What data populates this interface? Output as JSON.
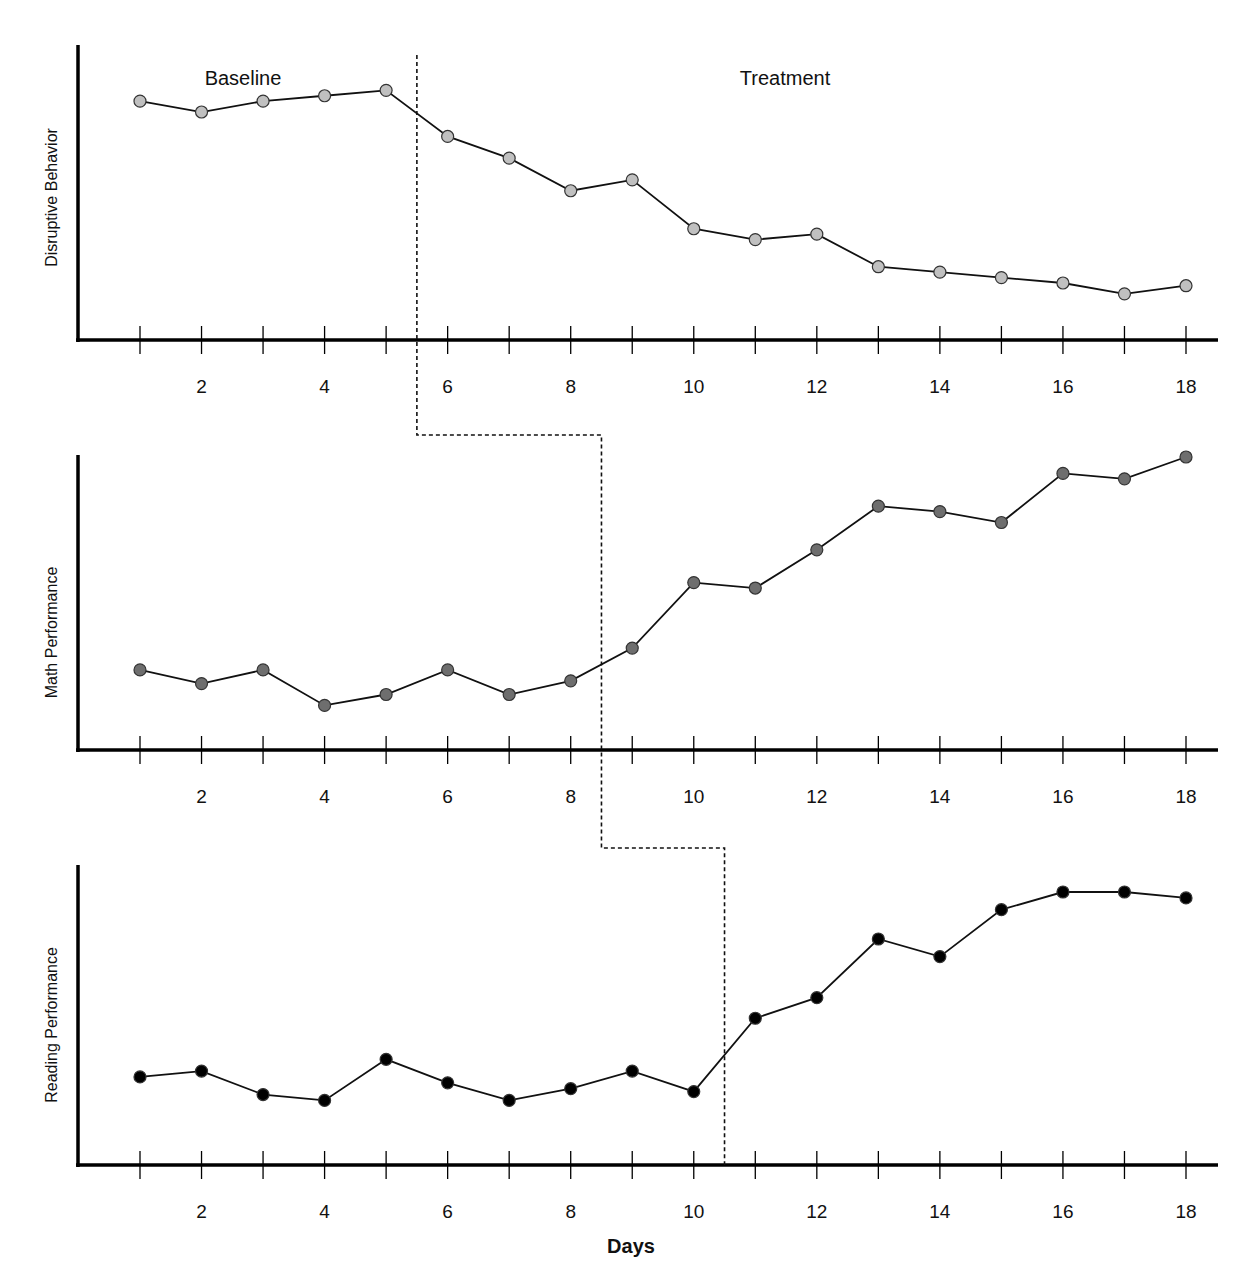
{
  "chart_data": {
    "type": "line",
    "title": "",
    "design": "multiple-baseline across behaviors",
    "xlabel": "Days",
    "x": [
      1,
      2,
      3,
      4,
      5,
      6,
      7,
      8,
      9,
      10,
      11,
      12,
      13,
      14,
      15,
      16,
      17,
      18
    ],
    "x_tick_labels": [
      "2",
      "4",
      "6",
      "8",
      "10",
      "12",
      "14",
      "16",
      "18"
    ],
    "x_tick_values": [
      2,
      4,
      6,
      8,
      10,
      12,
      14,
      16,
      18
    ],
    "phase_labels": [
      "Baseline",
      "Treatment"
    ],
    "grid": false,
    "legend": "none",
    "panels": [
      {
        "ylabel": "Disruptive Behavior",
        "marker_color": "#c0c0c0",
        "phase_change_after_day": 5.5,
        "ylim": [
          0,
          100
        ],
        "values": [
          88,
          84,
          88,
          90,
          92,
          75,
          67,
          55,
          59,
          41,
          37,
          39,
          27,
          25,
          23,
          21,
          17,
          20
        ]
      },
      {
        "ylabel": "Math Performance",
        "marker_color": "#6e6e6e",
        "phase_change_after_day": 8.5,
        "ylim": [
          0,
          100
        ],
        "values": [
          22,
          17,
          22,
          9,
          13,
          22,
          13,
          18,
          30,
          54,
          52,
          66,
          82,
          80,
          76,
          94,
          92,
          100
        ]
      },
      {
        "ylabel": "Reading Performance",
        "marker_color": "#000000",
        "phase_change_after_day": 10.5,
        "ylim": [
          0,
          100
        ],
        "values": [
          30,
          32,
          24,
          22,
          36,
          28,
          22,
          26,
          32,
          25,
          50,
          57,
          77,
          71,
          87,
          93,
          93,
          91
        ]
      }
    ]
  }
}
